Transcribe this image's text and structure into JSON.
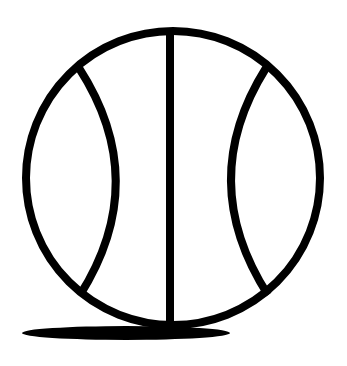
{
  "image": {
    "subject": "basketball-icon",
    "width": 347,
    "height": 366,
    "background_color": "#ffffff",
    "stroke_color": "#000000",
    "shadow_color": "#000000"
  },
  "ball": {
    "cx": 173,
    "cy": 178,
    "r": 147,
    "stroke_width": 8
  },
  "seams": {
    "vertical_line": {
      "x": 170,
      "y1": 28,
      "y2": 330,
      "width": 8
    },
    "left_arc": {
      "start": [
        79,
        68
      ],
      "control": [
        152,
        181
      ],
      "end": [
        80,
        295
      ],
      "width": 8
    },
    "right_arc": {
      "start": [
        266,
        68
      ],
      "control": [
        195,
        181
      ],
      "end": [
        268,
        295
      ],
      "width": 8
    }
  },
  "shadow": {
    "cx": 126,
    "cy": 333,
    "rx": 104,
    "ry": 7
  }
}
